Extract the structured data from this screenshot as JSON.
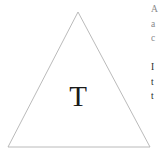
{
  "page": {
    "width": 160,
    "height": 151,
    "background_color": "#ffffff"
  },
  "figure": {
    "name": "triangle-diagram",
    "shape": "triangle",
    "stroke_color": "#b2b2b2",
    "fill": "none",
    "vertices": {
      "apex": [
        78,
        12
      ],
      "base_left": [
        8,
        147
      ],
      "base_right": [
        150,
        147
      ]
    },
    "label": {
      "text": "T",
      "color": "#1a1a1a"
    }
  },
  "clipped_text": {
    "upper_block": {
      "color": "#8a8a8a",
      "lines": [
        "A",
        "a",
        "c"
      ]
    },
    "lower_block": {
      "color": "#2b2b2b",
      "lines": [
        "I",
        "t",
        "t"
      ]
    }
  }
}
